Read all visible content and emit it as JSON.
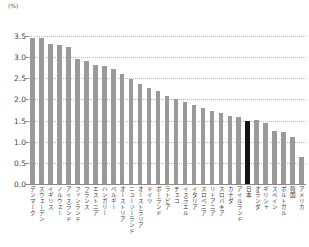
{
  "chart_data": {
    "type": "bar",
    "title": "",
    "subtitle": "",
    "unit_label": "(%)",
    "xlabel": "",
    "ylabel": "",
    "ylim": [
      0.0,
      3.5
    ],
    "ytick_labels": [
      "0.0",
      "0.5",
      "1.0",
      "1.5",
      "2.0",
      "2.5",
      "3.0",
      "3.5"
    ],
    "ytick_values": [
      0.0,
      0.5,
      1.0,
      1.5,
      2.0,
      2.5,
      3.0,
      3.5
    ],
    "grid": true,
    "legend": "none",
    "highlight_category": "日本",
    "highlight_color": "#141414",
    "bar_color": "#9a9a9a",
    "categories": [
      "デンマーク",
      "スウェーデン",
      "イギリス",
      "ノルウェー",
      "アイスランド",
      "フィンランド",
      "フランス",
      "エストニア",
      "ハンガリー",
      "ベルギー",
      "オーストリア",
      "ニュージーランド",
      "オーストラリア",
      "ドイツ",
      "ポーランド",
      "ラトビア",
      "チェコ",
      "イスラエル",
      "イタリア",
      "スロベニア",
      "リトアニア",
      "スロバキア",
      "カナダ",
      "アイルランド",
      "日本",
      "オランダ",
      "ギリシャ",
      "スペイン",
      "ポルトガル",
      "韓国",
      "アメリカ"
    ],
    "values": [
      3.45,
      3.45,
      3.32,
      3.28,
      3.25,
      2.95,
      2.9,
      2.82,
      2.78,
      2.73,
      2.6,
      2.49,
      2.36,
      2.28,
      2.21,
      2.08,
      2.02,
      1.95,
      1.88,
      1.8,
      1.73,
      1.68,
      1.62,
      1.58,
      1.5,
      1.52,
      1.44,
      1.26,
      1.22,
      1.12,
      0.65
    ]
  }
}
